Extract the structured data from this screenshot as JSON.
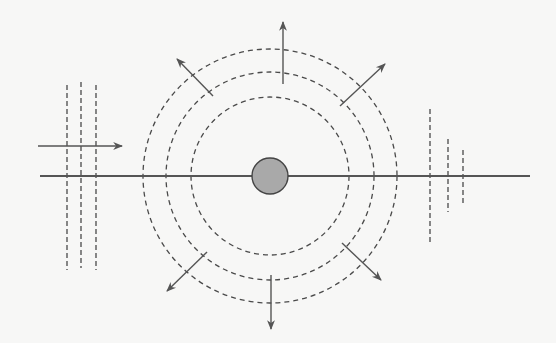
{
  "diagram": {
    "title": "",
    "colors": {
      "background": "#f7f7f6",
      "line": "#555555",
      "dashed": "#4a4a4a",
      "source_fill": "#a9a9a9",
      "source_stroke": "#444444"
    },
    "axis_line": {
      "x1": 40,
      "y1": 176,
      "x2": 530,
      "y2": 176
    },
    "source": {
      "cx": 270,
      "cy": 176,
      "r": 18
    },
    "wavefront_circles": [
      {
        "r": 79
      },
      {
        "r": 104
      },
      {
        "r": 127
      }
    ],
    "radial_arrows": [
      {
        "x1": 283,
        "y1": 84,
        "x2": 283,
        "y2": 22
      },
      {
        "x1": 213,
        "y1": 96,
        "x2": 177,
        "y2": 59
      },
      {
        "x1": 340,
        "y1": 106,
        "x2": 385,
        "y2": 64
      },
      {
        "x1": 207,
        "y1": 252,
        "x2": 167,
        "y2": 291
      },
      {
        "x1": 342,
        "y1": 243,
        "x2": 381,
        "y2": 280
      },
      {
        "x1": 271,
        "y1": 275,
        "x2": 271,
        "y2": 329
      }
    ],
    "plane_wave_left": {
      "lines": [
        {
          "x": 67,
          "y1": 85,
          "y2": 270
        },
        {
          "x": 81,
          "y1": 82,
          "y2": 268
        },
        {
          "x": 96,
          "y1": 85,
          "y2": 270
        }
      ],
      "arrow": {
        "x1": 38,
        "y1": 146,
        "x2": 122,
        "y2": 146
      }
    },
    "plane_wave_right": {
      "lines": [
        {
          "x": 430,
          "y1": 109,
          "y2": 243
        },
        {
          "x": 448,
          "y1": 139,
          "y2": 212
        },
        {
          "x": 463,
          "y1": 150,
          "y2": 203
        }
      ]
    }
  }
}
